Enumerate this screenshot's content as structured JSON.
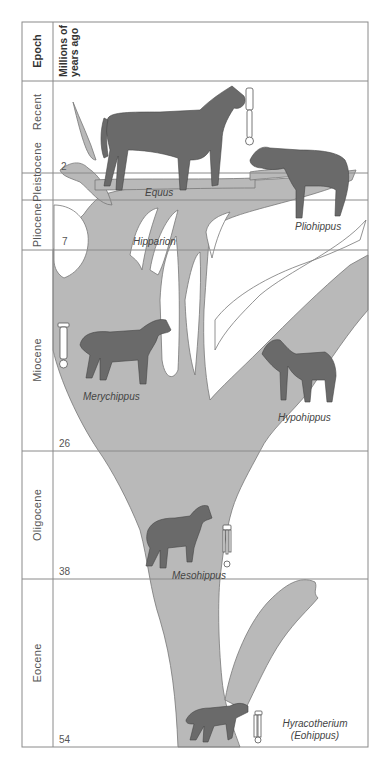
{
  "header": {
    "epoch_label": "Epoch",
    "mya_line1": "Millions of",
    "mya_line2": "years ago"
  },
  "epochs": [
    {
      "name": "Recent",
      "top": 81,
      "bottom": 173
    },
    {
      "name": "Pleistocene",
      "top": 173,
      "bottom": 200
    },
    {
      "name": "Pliocene",
      "top": 200,
      "bottom": 250
    },
    {
      "name": "Miocene",
      "top": 250,
      "bottom": 451
    },
    {
      "name": "Oligocene",
      "top": 451,
      "bottom": 579
    },
    {
      "name": "Eocene",
      "top": 579,
      "bottom": 747
    }
  ],
  "mya_marks": [
    "2",
    "7",
    "26",
    "38",
    "54"
  ],
  "species": {
    "equus": "Equus",
    "pliohippus": "Pliohippus",
    "hipparion": "Hipparion",
    "merychippus": "Merychippus",
    "hypohippus": "Hypohippus",
    "mesohippus": "Mesohippus",
    "hyracotherium": "Hyracotherium",
    "eohippus": "(Eohippus)"
  },
  "colors": {
    "tree": "#b8b8b8",
    "horse": "#6e6e6e",
    "grid": "#8a8a8a",
    "text": "#555555"
  }
}
